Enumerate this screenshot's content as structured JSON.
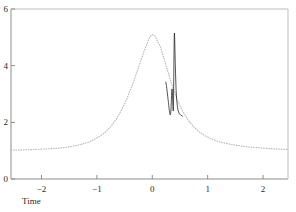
{
  "chart_data": {
    "type": "line",
    "title": "",
    "subtitle": "",
    "xlabel": "Time",
    "ylabel": "",
    "xlim": [
      -2.55,
      2.45
    ],
    "ylim": [
      0,
      6
    ],
    "grid": false,
    "legend": null,
    "xticks": [
      -2,
      -1,
      0,
      1,
      2
    ],
    "xticklabels": [
      "−2",
      "−1",
      "0",
      "1",
      "2"
    ],
    "yticks": [
      0,
      2,
      4,
      6
    ],
    "yticklabels": [
      "0",
      "2",
      "4",
      "6"
    ],
    "series": [
      {
        "name": "smooth envelope",
        "style": "dotted",
        "color": "#b9b9b9",
        "x": [
          -2.55,
          -2.45,
          -2.35,
          -2.25,
          -2.15,
          -2.05,
          -1.95,
          -1.85,
          -1.75,
          -1.65,
          -1.55,
          -1.45,
          -1.35,
          -1.25,
          -1.15,
          -1.05,
          -0.95,
          -0.85,
          -0.75,
          -0.65,
          -0.55,
          -0.45,
          -0.35,
          -0.25,
          -0.15,
          -0.05,
          0.0,
          0.05,
          0.15,
          0.25,
          0.35,
          0.45,
          0.55,
          0.65,
          0.75,
          0.85,
          0.95,
          1.05,
          1.15,
          1.25,
          1.35,
          1.45,
          1.55,
          1.65,
          1.75,
          1.85,
          1.95,
          2.05,
          2.15,
          2.25,
          2.35,
          2.45
        ],
        "y": [
          1.02,
          1.02,
          1.03,
          1.03,
          1.04,
          1.05,
          1.06,
          1.07,
          1.08,
          1.1,
          1.12,
          1.15,
          1.19,
          1.24,
          1.3,
          1.39,
          1.5,
          1.65,
          1.85,
          2.11,
          2.45,
          2.87,
          3.37,
          3.93,
          4.5,
          5.0,
          5.1,
          5.05,
          4.65,
          4.0,
          3.35,
          2.8,
          2.38,
          2.07,
          1.84,
          1.66,
          1.53,
          1.43,
          1.35,
          1.29,
          1.25,
          1.21,
          1.18,
          1.15,
          1.13,
          1.11,
          1.1,
          1.08,
          1.07,
          1.06,
          1.05,
          1.04
        ]
      },
      {
        "name": "resonance spike",
        "style": "solid",
        "color": "#1c1c1c",
        "x": [
          0.245,
          0.255,
          0.262,
          0.268,
          0.274,
          0.28,
          0.286,
          0.292,
          0.298,
          0.303,
          0.308,
          0.312,
          0.316,
          0.32,
          0.324,
          0.328,
          0.332,
          0.336,
          0.34,
          0.344,
          0.348,
          0.352,
          0.356,
          0.36,
          0.364,
          0.368,
          0.372,
          0.376,
          0.379,
          0.382,
          0.385,
          0.388,
          0.391,
          0.394,
          0.397,
          0.4,
          0.404,
          0.409,
          0.415,
          0.422,
          0.43,
          0.44,
          0.452,
          0.468,
          0.49,
          0.515,
          0.545
        ],
        "y": [
          3.42,
          3.3,
          3.2,
          3.1,
          3.0,
          2.9,
          2.8,
          2.7,
          2.6,
          2.5,
          2.42,
          2.36,
          2.31,
          2.28,
          2.26,
          2.27,
          2.31,
          2.4,
          2.55,
          2.75,
          2.95,
          3.1,
          3.18,
          3.14,
          3.0,
          2.8,
          2.6,
          2.45,
          2.4,
          2.55,
          3.0,
          3.6,
          4.2,
          4.7,
          5.0,
          5.15,
          5.0,
          4.6,
          4.1,
          3.6,
          3.15,
          2.82,
          2.58,
          2.4,
          2.3,
          2.25,
          2.22
        ]
      }
    ],
    "annotations": []
  },
  "axes": {
    "frame": {
      "left_label": "y-axis-spine",
      "bottom_label": "x-axis-spine",
      "top_label": "top-spine",
      "right_label": "right-spine"
    }
  }
}
